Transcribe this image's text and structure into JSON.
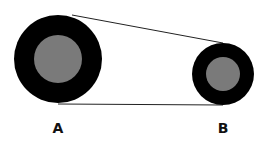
{
  "diagram": {
    "type": "belt-pulley",
    "pulleys": [
      {
        "label": "A",
        "cx": 58,
        "cy": 59,
        "outer_r": 44,
        "inner_r": 24
      },
      {
        "label": "B",
        "cx": 223,
        "cy": 74,
        "outer_r": 31,
        "inner_r": 17
      }
    ],
    "colors": {
      "outer": "#000000",
      "inner": "#7a7a7a",
      "belt": "#222222",
      "background": "#ffffff"
    }
  }
}
